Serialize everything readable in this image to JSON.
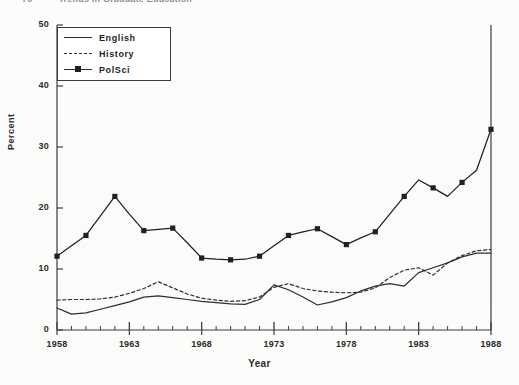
{
  "page": {
    "running_head": "Trends in Graduate Education",
    "page_number": "70"
  },
  "chart_data": {
    "type": "line",
    "title": "",
    "xlabel": "Year",
    "ylabel": "Percent",
    "xlim": [
      1958,
      1988
    ],
    "ylim": [
      0,
      50
    ],
    "yticks": [
      0,
      10,
      20,
      30,
      40,
      50
    ],
    "xticks": [
      1958,
      1963,
      1968,
      1973,
      1978,
      1983,
      1988
    ],
    "minor_xticks_every": 1,
    "grid": false,
    "legend_position": "upper-left",
    "x": [
      1958,
      1959,
      1960,
      1961,
      1962,
      1963,
      1964,
      1965,
      1966,
      1967,
      1968,
      1969,
      1970,
      1971,
      1972,
      1973,
      1974,
      1975,
      1976,
      1977,
      1978,
      1979,
      1980,
      1981,
      1982,
      1983,
      1984,
      1985,
      1986,
      1987,
      1988
    ],
    "series": [
      {
        "name": "English",
        "style": "solid",
        "marker": "none",
        "color": "#2e2e2e",
        "values": [
          3.6,
          2.6,
          2.8,
          3.4,
          4.0,
          4.6,
          5.4,
          5.6,
          5.3,
          5.0,
          4.7,
          4.5,
          4.3,
          4.2,
          5.0,
          7.4,
          6.6,
          5.4,
          4.1,
          4.6,
          5.3,
          6.4,
          7.2,
          7.6,
          7.2,
          9.4,
          10.2,
          11.0,
          12.0,
          12.6,
          12.6
        ]
      },
      {
        "name": "History",
        "style": "dashed",
        "marker": "none",
        "color": "#2e2e2e",
        "values": [
          4.9,
          5.0,
          5.0,
          5.1,
          5.4,
          6.0,
          6.8,
          7.9,
          6.9,
          5.9,
          5.2,
          4.9,
          4.7,
          4.8,
          5.4,
          7.0,
          7.6,
          6.8,
          6.4,
          6.2,
          6.1,
          6.2,
          6.9,
          8.6,
          9.8,
          10.2,
          9.0,
          11.0,
          12.2,
          13.0,
          13.2
        ]
      },
      {
        "name": "PolSci",
        "style": "solid",
        "marker": "square",
        "color": "#202020",
        "values": [
          12.1,
          13.8,
          15.5,
          18.7,
          21.9,
          19.0,
          16.3,
          16.5,
          16.7,
          14.3,
          11.8,
          11.6,
          11.5,
          11.6,
          12.1,
          13.8,
          15.5,
          16.1,
          16.6,
          15.3,
          14.0,
          15.1,
          16.1,
          19.0,
          21.9,
          24.6,
          23.3,
          21.9,
          24.2,
          26.2,
          32.9
        ]
      }
    ],
    "marker_years_polsci": [
      1958,
      1960,
      1962,
      1964,
      1966,
      1968,
      1970,
      1972,
      1974,
      1976,
      1978,
      1980,
      1982,
      1984,
      1986,
      1988
    ]
  }
}
